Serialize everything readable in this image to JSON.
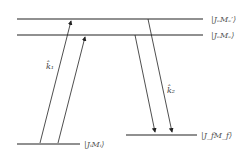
{
  "diagram": {
    "levels": [
      {
        "id": "excited-prime",
        "label": "|JₑMₑ′⟩"
      },
      {
        "id": "excited",
        "label": "|JₑMₑ⟩"
      },
      {
        "id": "initial",
        "label": "|JᵢMᵢ⟩"
      },
      {
        "id": "final",
        "label": "|J_fM_f⟩"
      }
    ],
    "arrows": [
      {
        "label": "k̂₁"
      },
      {
        "label": "k̂₂"
      }
    ],
    "colors": {
      "line": "#222222",
      "text": "#555555"
    }
  }
}
